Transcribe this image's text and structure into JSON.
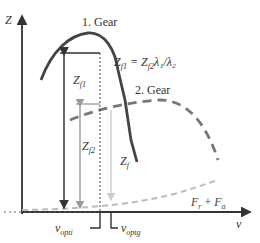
{
  "axes": {
    "y_label": "Z",
    "x_label": "v"
  },
  "curves": {
    "gear1_label": "1. Gear",
    "gear2_label": "2. Gear",
    "resistance_label_main": "F",
    "resistance_sub_r": "r",
    "resistance_plus": " + ",
    "resistance_label_main2": "F",
    "resistance_sub_a": "a"
  },
  "annotations": {
    "equation": "Z",
    "equation_sub1": "f1",
    "equation_mid": " = Z",
    "equation_sub2": "f2",
    "equation_tail": "λ₁/λ₂",
    "zf1_main": "Z",
    "zf1_sub": "f1",
    "zf2_main": "Z",
    "zf2_sub": "f2",
    "zf_main": "Z",
    "zf_sub": "f",
    "vopti_main": "v",
    "vopti_sub": "opti",
    "voptg_main": "v",
    "voptg_sub": "optg"
  },
  "colors": {
    "gear1": "#444444",
    "gear2": "#777777",
    "resistance": "#bbbbbb",
    "axis": "#333333",
    "grey_arrow": "#999999",
    "light_arrow": "#cccccc"
  }
}
